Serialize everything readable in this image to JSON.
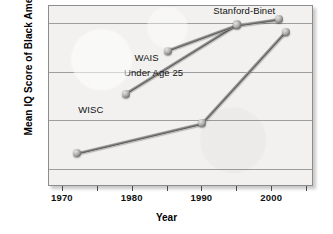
{
  "chart_data": {
    "type": "line",
    "title": "",
    "xlabel": "Year",
    "ylabel": "Mean IQ Score of Black Americans",
    "xlim": [
      1968,
      2006
    ],
    "ylim": [
      81.25,
      88.7
    ],
    "grid": true,
    "legend_position": "inline-annotations",
    "yticks": [
      82,
      84,
      86,
      88
    ],
    "xticks": [
      1970,
      1980,
      1990,
      2000
    ],
    "xminor_ticks": [
      1975,
      1985,
      1995,
      2005
    ],
    "series": [
      {
        "name": "WISC",
        "label": "WISC",
        "points": [
          {
            "x": 1972,
            "y": 82.65
          },
          {
            "x": 1990,
            "y": 83.88
          },
          {
            "x": 2002,
            "y": 87.65
          }
        ]
      },
      {
        "name": "WAIS",
        "label": "WAIS",
        "points": [
          {
            "x": 1979,
            "y": 85.1
          },
          {
            "x": 1995,
            "y": 87.95
          }
        ]
      },
      {
        "name": "Stanford-Binet",
        "label": "Stanford-Binet",
        "points": [
          {
            "x": 1985,
            "y": 86.85
          },
          {
            "x": 1995,
            "y": 87.9
          },
          {
            "x": 2001,
            "y": 88.15
          }
        ]
      }
    ],
    "annotations": [
      {
        "id": "stanford-binet",
        "text": "Stanford-Binet"
      },
      {
        "id": "wais",
        "text": "WAIS"
      },
      {
        "id": "under-age-25",
        "text": "Under Age 25"
      },
      {
        "id": "wisc",
        "text": "WISC"
      }
    ],
    "colors": {
      "panel_background": "#f2f1ef",
      "panel_border": "#8d8d8d",
      "gridline": "#8f8f8f",
      "line": "#6f6f6f",
      "marker": "#8a8a8a",
      "text": "#111111"
    }
  },
  "axes": {
    "y": {
      "label": "Mean IQ Score of Black Americans",
      "ticks": [
        {
          "value": 88,
          "label": "88"
        },
        {
          "value": 86,
          "label": "86"
        },
        {
          "value": 84,
          "label": "84"
        },
        {
          "value": 82,
          "label": "82"
        }
      ]
    },
    "x": {
      "label": "Year",
      "ticks": [
        {
          "value": 1970,
          "label": "1970"
        },
        {
          "value": 1980,
          "label": "1980"
        },
        {
          "value": 1990,
          "label": "1990"
        },
        {
          "value": 2000,
          "label": "2000"
        }
      ]
    }
  }
}
